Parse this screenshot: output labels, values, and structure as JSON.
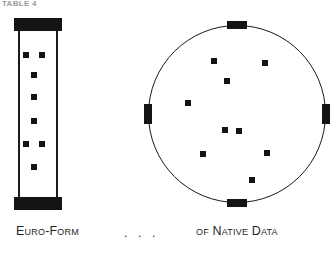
{
  "header": {
    "label": "TABLE 4"
  },
  "figure": {
    "colors": {
      "ink": "#141414",
      "outline": "#1a1a1a",
      "paper": "#ffffff",
      "header_ink": "#9a9a9a"
    },
    "column": {
      "name": "euro-form-column",
      "caps": [
        {
          "position": "top"
        },
        {
          "position": "bottom"
        }
      ],
      "dots": [
        {
          "x": 9,
          "y": 34
        },
        {
          "x": 25,
          "y": 34
        },
        {
          "x": 17,
          "y": 54
        },
        {
          "x": 17,
          "y": 76
        },
        {
          "x": 17,
          "y": 100
        },
        {
          "x": 9,
          "y": 123
        },
        {
          "x": 25,
          "y": 123
        },
        {
          "x": 17,
          "y": 146
        }
      ]
    },
    "circle": {
      "name": "native-data-circle",
      "markers": [
        {
          "position": "north"
        },
        {
          "position": "east"
        },
        {
          "position": "south"
        },
        {
          "position": "west"
        }
      ],
      "dots": [
        {
          "x": 63,
          "y": 33
        },
        {
          "x": 114,
          "y": 35
        },
        {
          "x": 76,
          "y": 53
        },
        {
          "x": 37,
          "y": 75
        },
        {
          "x": 74,
          "y": 102
        },
        {
          "x": 52,
          "y": 126
        },
        {
          "x": 116,
          "y": 125
        },
        {
          "x": 101,
          "y": 152
        },
        {
          "x": 88,
          "y": 103
        }
      ]
    }
  },
  "caption": {
    "left": "Euro-Form",
    "ellipsis": ". . .",
    "right": "of Native Data"
  }
}
